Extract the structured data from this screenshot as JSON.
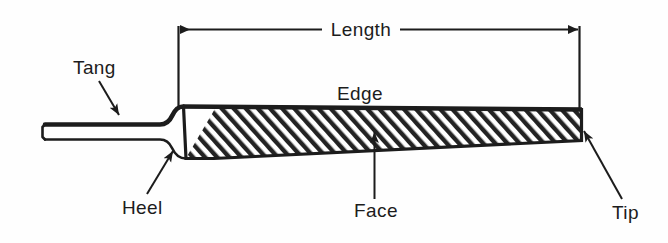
{
  "diagram": {
    "background_color": "#fefefe",
    "line_color": "#1c1c1c",
    "hatch_color": "#222222",
    "labels": {
      "length": "Length",
      "tang": "Tang",
      "edge": "Edge",
      "heel": "Heel",
      "face": "Face",
      "tip": "Tip"
    },
    "dimension": {
      "name": "Length",
      "type": "double-arrow-dimension",
      "spans": "heel-to-tip"
    },
    "callouts": [
      {
        "label": "Tang",
        "points_to": "tang-shank",
        "arrow": "down-right"
      },
      {
        "label": "Edge",
        "points_to": "blade-top-edge",
        "arrow": "none"
      },
      {
        "label": "Heel",
        "points_to": "heel-shoulder",
        "arrow": "up-right"
      },
      {
        "label": "Face",
        "points_to": "blade-face",
        "arrow": "up"
      },
      {
        "label": "Tip",
        "points_to": "blade-tip",
        "arrow": "up-left"
      }
    ]
  }
}
